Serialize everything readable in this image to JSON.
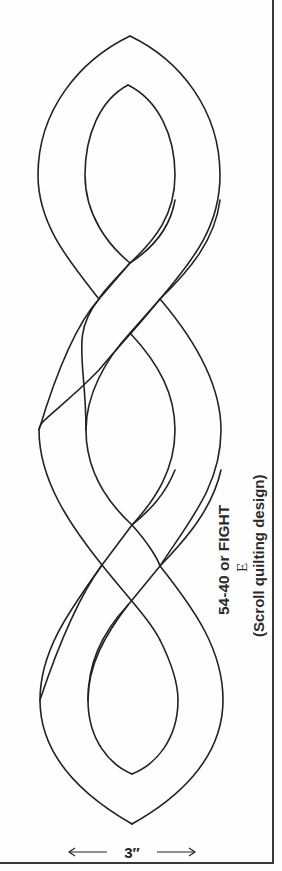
{
  "caption": {
    "title": "54-40 or FIGHT",
    "letter": "E",
    "subtitle": "(Scroll quilting design)"
  },
  "measurement": {
    "label": "3″",
    "icon_left": "arrow-left-icon",
    "icon_right": "arrow-right-icon"
  },
  "design": {
    "type": "scroll-cable-quilting-template",
    "lobes": 3,
    "crossings": 2,
    "line_color": "#222222",
    "background": "#ffffff"
  }
}
